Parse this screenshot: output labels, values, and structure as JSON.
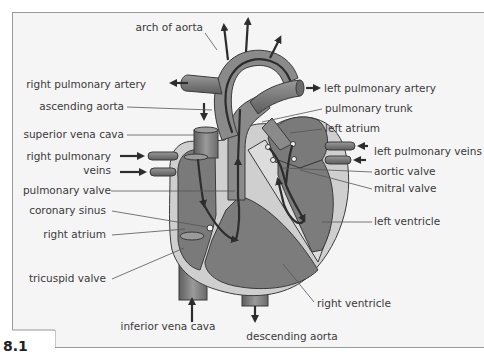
{
  "figure": {
    "number": "8.1",
    "background": "#f5f5f5",
    "frame_color": "#9a9a9a"
  },
  "colors": {
    "vessel_dark": "#6e6e6e",
    "vessel_mid": "#8a8a8a",
    "chamber_fill": "#7a7a7a",
    "wall_light": "#c8c8c8",
    "wall_lighter": "#dcdcdc",
    "flow_arrow": "#2d2d2d",
    "label_text": "#3a3a3a"
  },
  "labels": {
    "arch_of_aorta": "arch of aorta",
    "right_pulmonary_artery": "right pulmonary artery",
    "ascending_aorta": "ascending aorta",
    "superior_vena_cava": "superior vena cava",
    "right_pulmonary_veins_line1": "right pulmonary",
    "right_pulmonary_veins_line2": "veins",
    "pulmonary_valve": "pulmonary valve",
    "coronary_sinus": "coronary sinus",
    "right_atrium": "right atrium",
    "tricuspid_valve": "tricuspid valve",
    "inferior_vena_cava": "inferior vena cava",
    "descending_aorta": "descending aorta",
    "left_pulmonary_artery": "left pulmonary artery",
    "pulmonary_trunk": "pulmonary trunk",
    "left_atrium": "left atrium",
    "left_pulmonary_veins": "left pulmonary veins",
    "aortic_valve": "aortic valve",
    "mitral_valve": "mitral valve",
    "left_ventricle": "left ventricle",
    "right_ventricle": "right ventricle"
  }
}
